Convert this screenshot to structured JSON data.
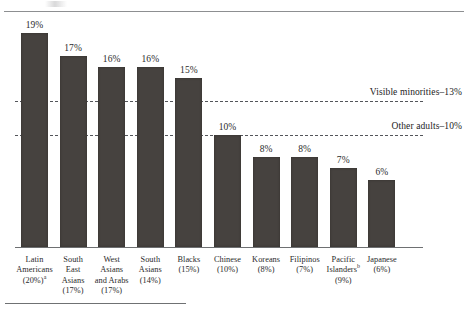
{
  "chart_data": {
    "type": "bar",
    "title": "",
    "xlabel": "",
    "ylabel": "",
    "ylim": [
      0,
      21
    ],
    "grid": false,
    "legend_position": "none",
    "categories": [
      "Latin Americans (20%)",
      "South East Asians (17%)",
      "West Asians and Arabs (17%)",
      "South Asians (14%)",
      "Blacks (15%)",
      "Chinese (10%)",
      "Koreans (8%)",
      "Filipinos (7%)",
      "Pacific Islanders (9%)",
      "Japanese (6%)"
    ],
    "values": [
      19,
      17,
      16,
      16,
      15,
      10,
      8,
      8,
      7,
      6
    ],
    "value_labels": [
      "19%",
      "17%",
      "16%",
      "16%",
      "15%",
      "10%",
      "8%",
      "8%",
      "7%",
      "6%"
    ],
    "bar_color": "#46423f",
    "reference_lines": [
      {
        "label": "Visible minorities–13%",
        "value": 13
      },
      {
        "label": "Other adults–10%",
        "value": 10
      }
    ]
  },
  "axis": {
    "categories": [
      {
        "lines": [
          "Latin",
          "Americans",
          "(20%)"
        ],
        "superscript": "a",
        "superscript_line": 2
      },
      {
        "lines": [
          "South",
          "East",
          "Asians",
          "(17%)"
        ],
        "superscript": "",
        "superscript_line": -1
      },
      {
        "lines": [
          "West",
          "Asians",
          "and Arabs",
          "(17%)"
        ],
        "superscript": "",
        "superscript_line": -1
      },
      {
        "lines": [
          "South",
          "Asians",
          "(14%)"
        ],
        "superscript": "",
        "superscript_line": -1
      },
      {
        "lines": [
          "Blacks",
          "(15%)"
        ],
        "superscript": "",
        "superscript_line": -1
      },
      {
        "lines": [
          "Chinese",
          "(10%)"
        ],
        "superscript": "",
        "superscript_line": -1
      },
      {
        "lines": [
          "Koreans",
          "(8%)"
        ],
        "superscript": "",
        "superscript_line": -1
      },
      {
        "lines": [
          "Filipinos",
          "(7%)"
        ],
        "superscript": "",
        "superscript_line": -1
      },
      {
        "lines": [
          "Pacific",
          "Islanders",
          "(9%)"
        ],
        "superscript": "b",
        "superscript_line": 1
      },
      {
        "lines": [
          "Japanese",
          "(6%)"
        ],
        "superscript": "",
        "superscript_line": -1
      }
    ]
  }
}
